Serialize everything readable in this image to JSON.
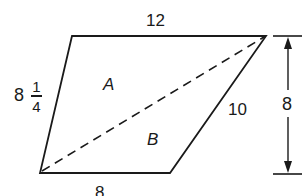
{
  "diagram": {
    "shape": "parallelogram-like quadrilateral split by diagonal into two triangles",
    "labels": {
      "top": "12",
      "left_whole": "8",
      "left_num": "1",
      "left_den": "4",
      "right_side": "10",
      "height": "8",
      "bottom": "8",
      "region_a": "A",
      "region_b": "B"
    },
    "vertices": {
      "top_left": [
        72,
        36
      ],
      "top_right": [
        266,
        36
      ],
      "bottom_right": [
        170,
        173
      ],
      "bottom_left": [
        40,
        173
      ]
    },
    "diagonal": "dashed from bottom-left to top-right",
    "height_dimension": "vertical double-arrow at right with extension ticks",
    "colors": {
      "line": "#1a1a1a",
      "background": "#ffffff"
    }
  }
}
